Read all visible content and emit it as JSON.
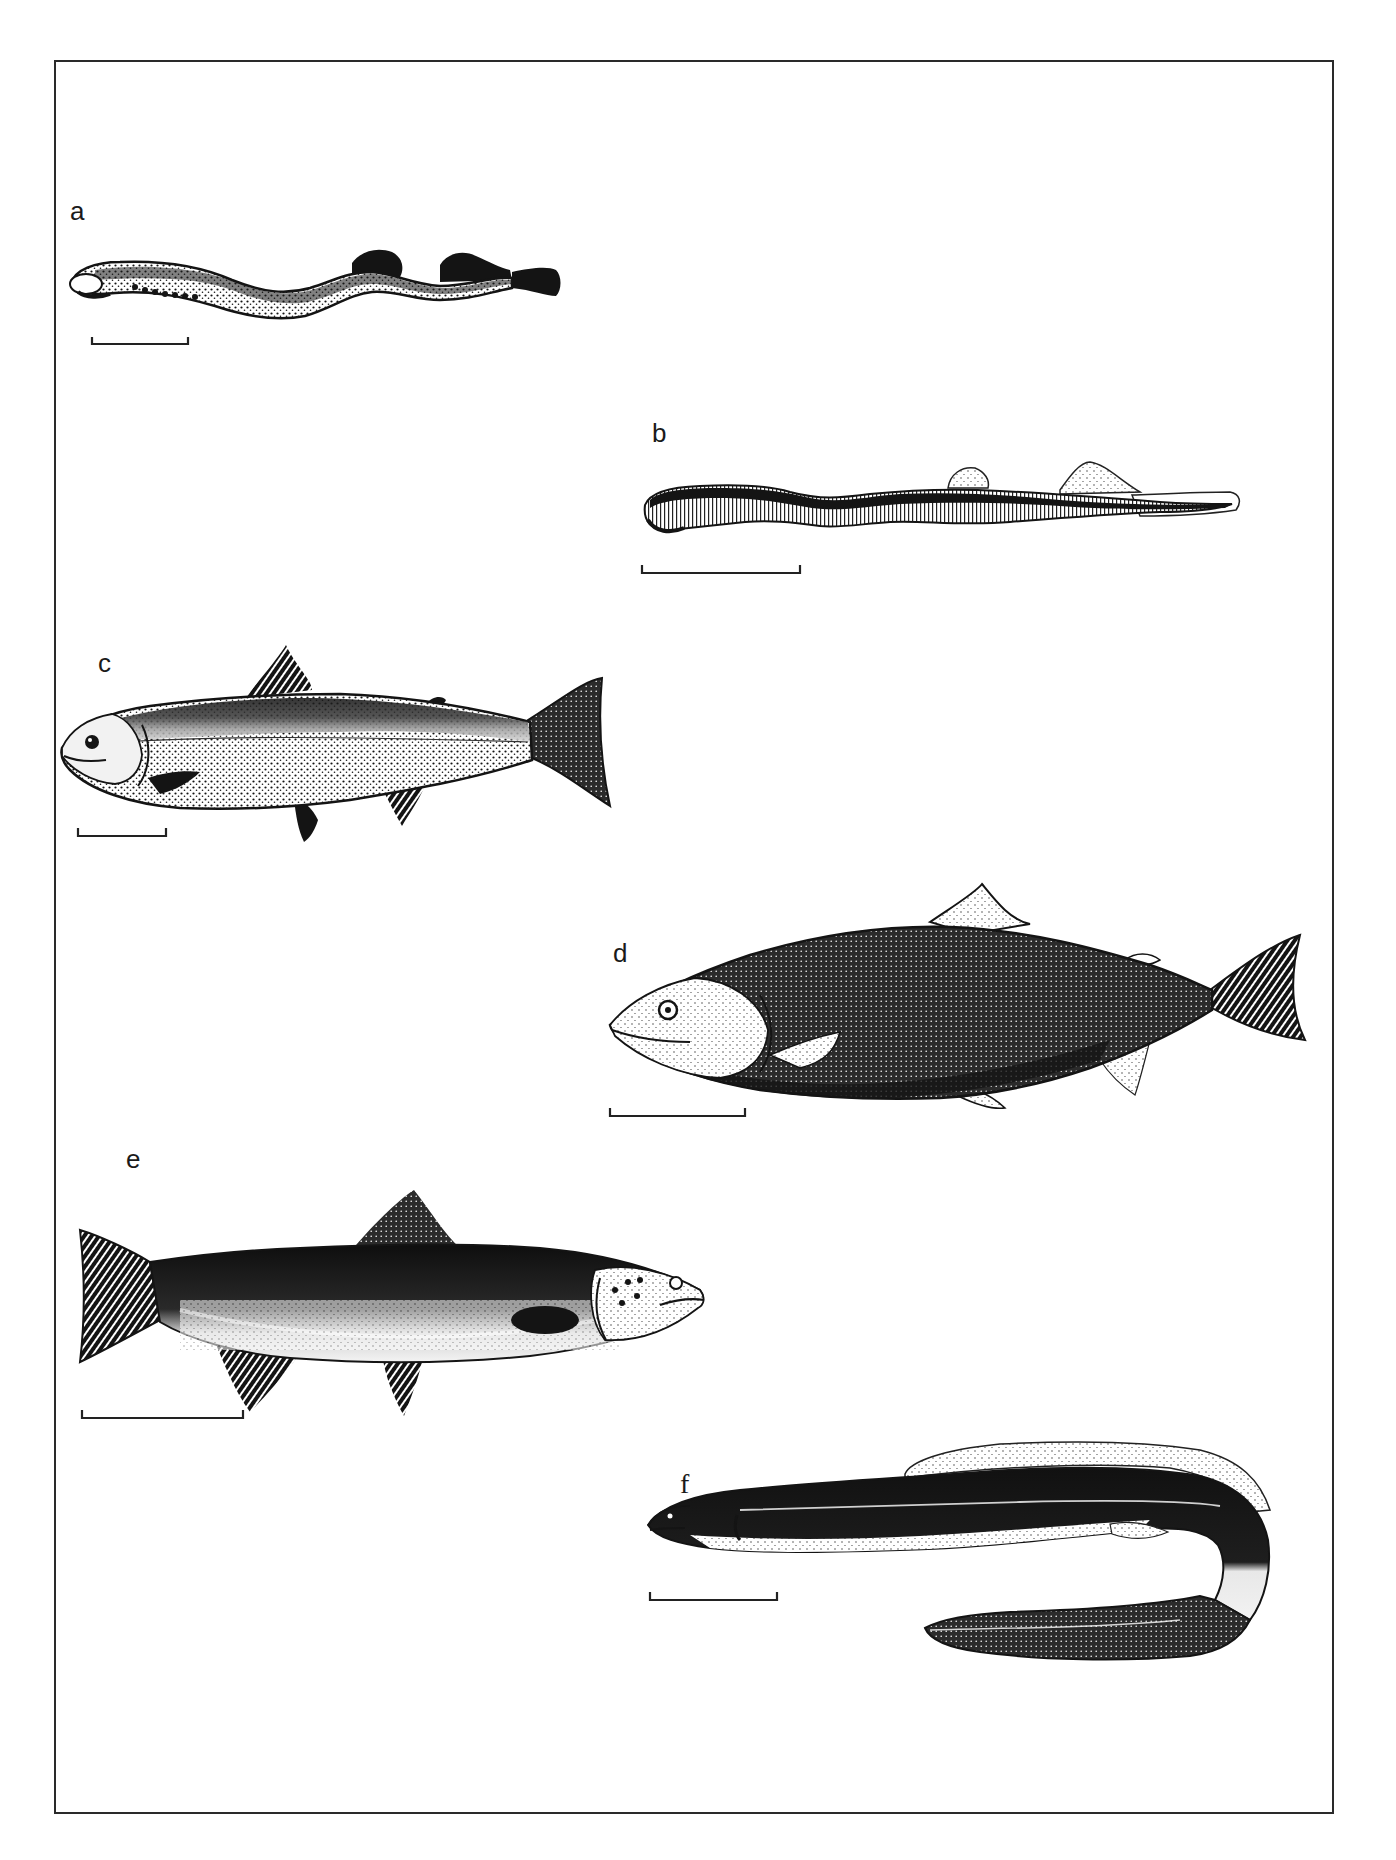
{
  "figure": {
    "panels": [
      {
        "id": "a",
        "label": "a",
        "subject": "lamprey",
        "facing": "left",
        "scale_bar": true
      },
      {
        "id": "b",
        "label": "b",
        "subject": "lamprey-larva",
        "facing": "left",
        "scale_bar": true
      },
      {
        "id": "c",
        "label": "c",
        "subject": "salmon",
        "facing": "left",
        "scale_bar": true
      },
      {
        "id": "d",
        "label": "d",
        "subject": "humpback-salmon",
        "facing": "left",
        "scale_bar": true
      },
      {
        "id": "e",
        "label": "e",
        "subject": "trout",
        "facing": "right",
        "scale_bar": true
      },
      {
        "id": "f",
        "label": "f",
        "subject": "eel",
        "facing": "left",
        "scale_bar": true
      }
    ]
  },
  "colors": {
    "ink": "#141414",
    "mid": "#5a5a5a",
    "paper": "#ffffff",
    "frame": "#2a2a2a"
  }
}
